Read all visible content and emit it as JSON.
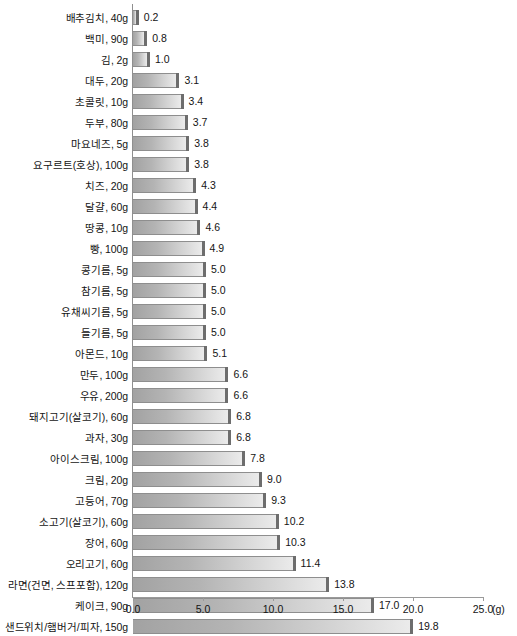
{
  "chart_data": {
    "type": "bar",
    "orientation": "horizontal",
    "title": "",
    "xlabel": "(g)",
    "ylabel": "",
    "xlim": [
      0.0,
      25.0
    ],
    "xticks": [
      "0.0",
      "5.0",
      "10.0",
      "15.0",
      "20.0",
      "25.0"
    ],
    "xtick_values": [
      0.0,
      5.0,
      10.0,
      15.0,
      20.0,
      25.0
    ],
    "grid": false,
    "legend": false,
    "unit": "(g)",
    "categories": [
      "배추김치, 40g",
      "백미, 90g",
      "김, 2g",
      "대두, 20g",
      "초콜릿, 10g",
      "두부, 80g",
      "마요네즈, 5g",
      "요구르트(호상), 100g",
      "치즈, 20g",
      "달걀, 60g",
      "땅콩, 10g",
      "빵, 100g",
      "콩기름, 5g",
      "참기름, 5g",
      "유채씨기름, 5g",
      "들기름, 5g",
      "아몬드, 10g",
      "만두, 100g",
      "우유, 200g",
      "돼지고기(살코기), 60g",
      "과자, 30g",
      "아이스크림, 100g",
      "크림, 20g",
      "고등어, 70g",
      "소고기(살코기), 60g",
      "장어, 60g",
      "오리고기, 60g",
      "라면(건면, 스프포함), 120g",
      "케이크, 90g",
      "샌드위치/햄버거/피자, 150g"
    ],
    "values": [
      0.2,
      0.8,
      1.0,
      3.1,
      3.4,
      3.7,
      3.8,
      3.8,
      4.3,
      4.4,
      4.6,
      4.9,
      5.0,
      5.0,
      5.0,
      5.0,
      5.1,
      6.6,
      6.6,
      6.8,
      6.8,
      7.8,
      9.0,
      9.3,
      10.2,
      10.3,
      11.4,
      13.8,
      17.0,
      19.8
    ],
    "value_labels": [
      "0.2",
      "0.8",
      "1.0",
      "3.1",
      "3.4",
      "3.7",
      "3.8",
      "3.8",
      "4.3",
      "4.4",
      "4.6",
      "4.9",
      "5.0",
      "5.0",
      "5.0",
      "5.0",
      "5.1",
      "6.6",
      "6.6",
      "6.8",
      "6.8",
      "7.8",
      "9.0",
      "9.3",
      "10.2",
      "10.3",
      "11.4",
      "13.8",
      "17.0",
      "19.8"
    ],
    "colors": {
      "bar_gradient_start": "#a2a2a2",
      "bar_gradient_end": "#ebebeb",
      "bar_cap": "#6d6d6d",
      "bar_border": "#8e8e8e",
      "axis": "#9a9a9a",
      "text": "#141414",
      "background": "#ffffff"
    }
  }
}
